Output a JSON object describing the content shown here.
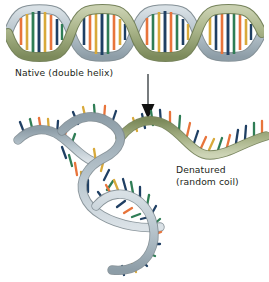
{
  "figure": {
    "title_alt": "DNA denaturation diagram",
    "background_color": "#ffffff"
  },
  "labels": {
    "native": "Native (double helix)",
    "denatured_line1": "Denatured",
    "denatured_line2": "(random coil)"
  },
  "arrow": {
    "name": "downward-arrow",
    "color": "#1a1a1a",
    "x": 148,
    "y_start": 74,
    "y_end": 118
  },
  "palette": {
    "strand_green": "#a9b489",
    "strand_green_dark": "#7d8a5c",
    "strand_green_light": "#c8cfae",
    "strand_blue": "#b9c6ce",
    "strand_blue_dark": "#8e9ea8",
    "strand_blue_light": "#d4dde2",
    "base_orange": "#e8743b",
    "base_navy": "#1f3f63",
    "base_teal": "#2f7d55",
    "base_gold": "#d8a93a",
    "outline": "#6d7a80",
    "text": "#231f20"
  },
  "helix": {
    "name": "dna-double-helix",
    "turns": 4,
    "x_start": 8,
    "x_end": 262,
    "y_center": 33,
    "amplitude": 24,
    "period": 63,
    "rung_colors": [
      "#e8743b",
      "#1f3f63",
      "#2f7d55",
      "#d8a93a"
    ]
  },
  "coils": [
    {
      "name": "denatured-strand-upper",
      "color": "strand_green",
      "description": "wavy sage-green single strand with projecting bases, upper right"
    },
    {
      "name": "denatured-strand-middle",
      "color": "strand_blue",
      "description": "grey-blue single strand curving from upper left down to lower right"
    },
    {
      "name": "denatured-strand-lower",
      "color": "strand_blue",
      "description": "grey-blue single strand forming a hook at bottom"
    }
  ]
}
